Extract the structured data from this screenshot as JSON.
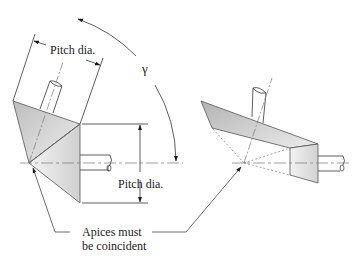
{
  "figure": {
    "type": "technical-diagram"
  },
  "labels": {
    "pitch_dia_top": "Pitch dia.",
    "pitch_dia_right": "Pitch dia.",
    "gamma": "γ",
    "apices_line1": "Apices must",
    "apices_line2": "be coincident"
  },
  "colors": {
    "stroke": "#3a3a3a",
    "fill_light": "#e9e9e9",
    "fill_dark": "#b8b8b8",
    "text": "#1a1a1a"
  }
}
